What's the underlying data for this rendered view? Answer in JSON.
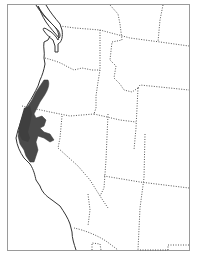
{
  "map": {
    "type": "range-map",
    "region": "Western United States",
    "highlighted_range": "Northern California and southwestern Oregon coastal region",
    "colors": {
      "background": "#ffffff",
      "frame": "#9a9a9a",
      "coastline": "#333333",
      "state_borders": "#555555",
      "range_fill": "#4a4a4a"
    },
    "legend": ""
  }
}
